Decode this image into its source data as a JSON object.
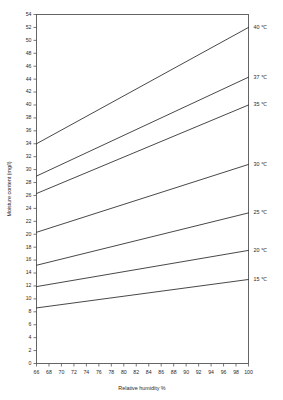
{
  "chart_data": {
    "type": "line",
    "title": "",
    "xlabel": "Relative humidity %",
    "ylabel": "Moisture content (mg/l)",
    "xlim": [
      66,
      100
    ],
    "ylim": [
      0,
      54
    ],
    "xticks": [
      66,
      68,
      70,
      72,
      74,
      76,
      78,
      80,
      82,
      84,
      86,
      88,
      90,
      92,
      94,
      96,
      98,
      100
    ],
    "yticks": [
      0,
      2,
      4,
      6,
      8,
      10,
      12,
      14,
      16,
      18,
      20,
      22,
      24,
      26,
      28,
      30,
      32,
      34,
      36,
      38,
      40,
      42,
      44,
      46,
      48,
      50,
      52,
      54
    ],
    "xtick_labels": [
      "66",
      "68",
      "70",
      "72",
      "74",
      "76",
      "78",
      "80",
      "82",
      "84",
      "86",
      "88",
      "90",
      "92",
      "94",
      "96",
      "98",
      "100"
    ],
    "ytick_labels": [
      "0",
      "2",
      "4",
      "6",
      "8",
      "10",
      "12",
      "14",
      "16",
      "18",
      "20",
      "22",
      "24",
      "26",
      "28",
      "30",
      "32",
      "34",
      "36",
      "38",
      "40",
      "42",
      "44",
      "46",
      "48",
      "50",
      "52",
      "54"
    ],
    "grid": false,
    "legend_position": "right-inline-labels",
    "x": [
      66,
      100
    ],
    "series": [
      {
        "name": "40 ℃",
        "label": "40 ℃",
        "temperature_c": 40,
        "values": [
          34.0,
          52.0
        ],
        "color": "#333333"
      },
      {
        "name": "37 ℃",
        "label": "37 ℃",
        "temperature_c": 37,
        "values": [
          29.0,
          44.3
        ],
        "color": "#333333"
      },
      {
        "name": "35 ℃",
        "label": "35 ℃",
        "temperature_c": 35,
        "values": [
          26.3,
          40.0
        ],
        "color": "#333333"
      },
      {
        "name": "30 ℃",
        "label": "30 ℃",
        "temperature_c": 30,
        "values": [
          20.3,
          30.8
        ],
        "color": "#333333"
      },
      {
        "name": "25 ℃",
        "label": "25 ℃",
        "temperature_c": 25,
        "values": [
          15.2,
          23.3
        ],
        "color": "#333333"
      },
      {
        "name": "20 ℃",
        "label": "20 ℃",
        "temperature_c": 20,
        "values": [
          11.9,
          17.5
        ],
        "color": "#333333"
      },
      {
        "name": "15 ℃",
        "label": "15 ℃",
        "temperature_c": 15,
        "values": [
          8.6,
          13.0
        ],
        "color": "#333333"
      }
    ]
  },
  "colors": {
    "background": "#ffffff",
    "axis": "#555555",
    "curve": "#333333",
    "text": "#2a2a2a"
  }
}
